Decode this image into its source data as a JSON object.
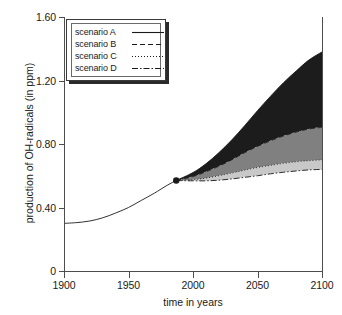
{
  "chart_data": {
    "type": "line",
    "title": "",
    "xlabel": "time in years",
    "ylabel": "production of OH-radicals (in ppm)",
    "xlim": [
      1900,
      2100
    ],
    "ylim": [
      0,
      1.6
    ],
    "xticks": [
      1900,
      1950,
      2000,
      2050,
      2100
    ],
    "xticklabels": [
      "1900",
      "1950",
      "2000",
      "2050",
      "2100"
    ],
    "yticks": [
      0,
      0.4,
      0.8,
      1.2,
      1.6
    ],
    "yticklabels": [
      "0",
      "0.40",
      "0.80",
      "1.20",
      "1.60"
    ],
    "grid": false,
    "legend_position": "upper left",
    "branch_point": {
      "x": 1987,
      "y": 0.57,
      "marker": "filled-circle"
    },
    "historical": {
      "name": "historical record",
      "style": "solid",
      "x": [
        1900,
        1910,
        1920,
        1930,
        1940,
        1950,
        1960,
        1970,
        1980,
        1987
      ],
      "y": [
        0.3,
        0.305,
        0.315,
        0.335,
        0.365,
        0.4,
        0.445,
        0.49,
        0.54,
        0.57
      ]
    },
    "series": [
      {
        "name": "scenario A",
        "style": "solid",
        "x": [
          1987,
          2000,
          2010,
          2020,
          2030,
          2040,
          2050,
          2060,
          2070,
          2080,
          2090,
          2100
        ],
        "y": [
          0.57,
          0.62,
          0.675,
          0.745,
          0.825,
          0.915,
          1.01,
          1.1,
          1.185,
          1.26,
          1.33,
          1.38
        ]
      },
      {
        "name": "scenario B",
        "style": "dashed",
        "x": [
          1987,
          2000,
          2010,
          2020,
          2030,
          2040,
          2050,
          2060,
          2070,
          2080,
          2090,
          2100
        ],
        "y": [
          0.57,
          0.595,
          0.625,
          0.66,
          0.7,
          0.745,
          0.785,
          0.82,
          0.85,
          0.875,
          0.895,
          0.905
        ]
      },
      {
        "name": "scenario C",
        "style": "dotted",
        "x": [
          1987,
          2000,
          2010,
          2020,
          2030,
          2040,
          2050,
          2060,
          2070,
          2080,
          2090,
          2100
        ],
        "y": [
          0.57,
          0.575,
          0.585,
          0.6,
          0.617,
          0.635,
          0.652,
          0.665,
          0.678,
          0.688,
          0.695,
          0.7
        ]
      },
      {
        "name": "scenario D",
        "style": "dash-dot",
        "x": [
          1987,
          2000,
          2010,
          2020,
          2030,
          2040,
          2050,
          2060,
          2070,
          2080,
          2090,
          2100
        ],
        "y": [
          0.57,
          0.568,
          0.568,
          0.572,
          0.58,
          0.59,
          0.6,
          0.612,
          0.622,
          0.63,
          0.637,
          0.64
        ]
      }
    ],
    "bands": [
      {
        "name": "band-A-B",
        "upper": "scenario A",
        "lower": "scenario B",
        "color": "#1c1c1c"
      },
      {
        "name": "band-B-C",
        "upper": "scenario B",
        "lower": "scenario C",
        "color": "#808080"
      },
      {
        "name": "band-C-D",
        "upper": "scenario C",
        "lower": "scenario D",
        "color": "#c8c8c8"
      }
    ]
  },
  "legend": {
    "entries": [
      {
        "label": "scenario A",
        "style": "solid"
      },
      {
        "label": "scenario B",
        "style": "dashed"
      },
      {
        "label": "scenario C",
        "style": "dotted"
      },
      {
        "label": "scenario D",
        "style": "dash-dot"
      }
    ]
  },
  "colors": {
    "axis": "#4d4d4d",
    "line": "#1a1a1a",
    "band_dark": "#1c1c1c",
    "band_mid": "#808080",
    "band_light": "#c8c8c8",
    "background": "#ffffff"
  }
}
